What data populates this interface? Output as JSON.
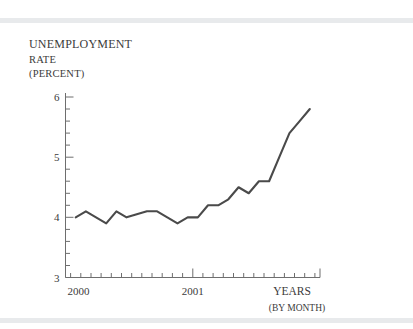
{
  "figure": {
    "background_color": "#ffffff",
    "rule_color": "#e8eaec",
    "line_color": "#4a4a4a",
    "axis_color": "#6e6e6e",
    "text_color": "#3b3b3b"
  },
  "labels": {
    "y_axis_title_line1": "UNEMPLOYMENT",
    "y_axis_title_line2": "RATE",
    "y_axis_title_line3": "(PERCENT)",
    "x_axis_caption": "YEARS",
    "x_axis_subcaption": "(BY MONTH)"
  },
  "chart_data": {
    "type": "line",
    "title": "",
    "subtitle": "",
    "xlabel": "YEARS (BY MONTH)",
    "ylabel": "UNEMPLOYMENT RATE (PERCENT)",
    "ylim": [
      3,
      6
    ],
    "yticks": [
      3,
      4,
      5,
      6
    ],
    "ytick_labels": [
      "3",
      "4",
      "5",
      "6"
    ],
    "y_minor_tick_step": 0.2,
    "xlim": [
      "2000-01",
      "2001-12"
    ],
    "xticks": [
      "2000",
      "2001"
    ],
    "xtick_labels": [
      "2000",
      "2001"
    ],
    "x_minor_ticks": "monthly",
    "grid": false,
    "legend": false,
    "x": [
      "2000-01",
      "2000-02",
      "2000-03",
      "2000-04",
      "2000-05",
      "2000-06",
      "2000-07",
      "2000-08",
      "2000-09",
      "2000-10",
      "2000-11",
      "2000-12",
      "2001-01",
      "2001-02",
      "2001-03",
      "2001-04",
      "2001-05",
      "2001-06",
      "2001-07",
      "2001-08",
      "2001-09",
      "2001-10",
      "2001-11",
      "2001-12"
    ],
    "categories": [
      "Jan 2000",
      "Feb 2000",
      "Mar 2000",
      "Apr 2000",
      "May 2000",
      "Jun 2000",
      "Jul 2000",
      "Aug 2000",
      "Sep 2000",
      "Oct 2000",
      "Nov 2000",
      "Dec 2000",
      "Jan 2001",
      "Feb 2001",
      "Mar 2001",
      "Apr 2001",
      "May 2001",
      "Jun 2001",
      "Jul 2001",
      "Aug 2001",
      "Sep 2001",
      "Oct 2001",
      "Nov 2001",
      "Dec 2001"
    ],
    "series": [
      {
        "name": "Unemployment rate",
        "color": "#4a4a4a",
        "values": [
          4.0,
          4.1,
          4.0,
          3.9,
          4.1,
          4.0,
          4.05,
          4.1,
          4.1,
          4.0,
          3.9,
          4.0,
          4.0,
          4.2,
          4.2,
          4.3,
          4.5,
          4.4,
          4.6,
          4.6,
          5.0,
          5.4,
          5.6,
          5.8
        ]
      }
    ],
    "annotations": []
  }
}
